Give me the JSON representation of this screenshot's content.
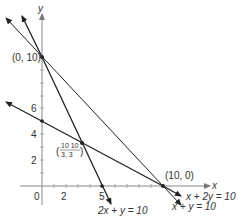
{
  "axes": {
    "x_label": "x",
    "y_label": "y",
    "x_ticks": [
      "0",
      "2",
      "5"
    ],
    "y_ticks": [
      "2",
      "4",
      "6"
    ]
  },
  "points": {
    "p1": "(0, 10)",
    "p2": "(10, 0)",
    "p3_num": "10  10",
    "p3_den": "3,  3"
  },
  "lines": {
    "l1": "x + y = 10",
    "l2": "2x + y = 10",
    "l3": "x + 2y = 10"
  },
  "colors": {
    "line": "#222222",
    "axis": "#888888"
  }
}
